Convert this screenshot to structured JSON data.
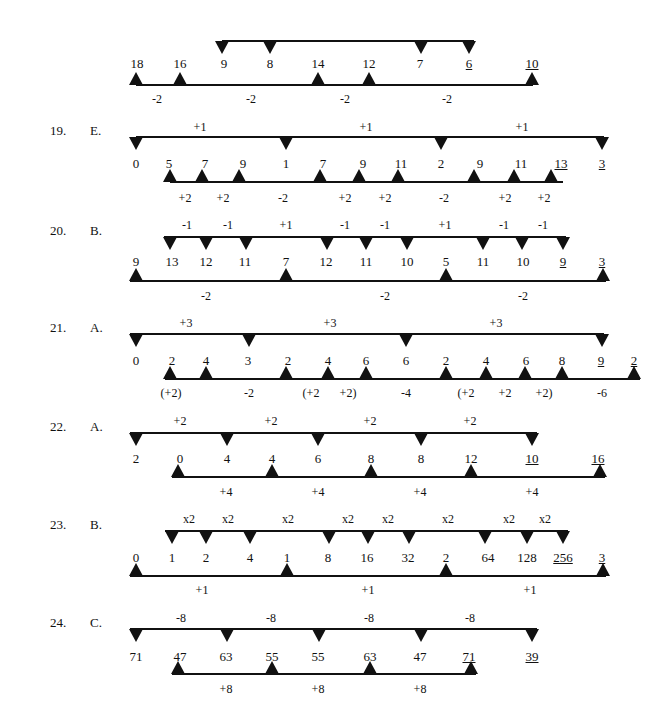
{
  "rows": [
    {
      "id": "top-continued",
      "question": "",
      "answer": "",
      "top_line": {
        "y": 40,
        "x1": 222,
        "x2": 474,
        "markers": [
          222,
          270,
          421,
          469
        ]
      },
      "bottom_line": {
        "y": 84,
        "x1": 136,
        "x2": 533,
        "markers": [
          136,
          180,
          318,
          369,
          532
        ]
      },
      "numbers_y": 57,
      "numbers": [
        {
          "x": 137,
          "v": "18",
          "u": false
        },
        {
          "x": 180,
          "v": "16",
          "u": false
        },
        {
          "x": 224,
          "v": "9",
          "u": false
        },
        {
          "x": 270,
          "v": "8",
          "u": false
        },
        {
          "x": 318,
          "v": "14",
          "u": false
        },
        {
          "x": 369,
          "v": "12",
          "u": false
        },
        {
          "x": 420,
          "v": "7",
          "u": false
        },
        {
          "x": 469,
          "v": "6",
          "u": true
        },
        {
          "x": 532,
          "v": "10",
          "u": true
        }
      ],
      "top_labels_y": 0,
      "top_labels": [],
      "bottom_labels_y": 92,
      "bottom_labels": [
        {
          "x": 157,
          "t": "-2"
        },
        {
          "x": 251,
          "t": "-2"
        },
        {
          "x": 345,
          "t": "-2"
        },
        {
          "x": 447,
          "t": "-2"
        }
      ]
    },
    {
      "id": "q19",
      "question": "19.",
      "answer": "E.",
      "top_line": {
        "y": 136,
        "x1": 136,
        "x2": 604,
        "markers": [
          136,
          286,
          441,
          602
        ]
      },
      "bottom_line": {
        "y": 181,
        "x1": 170,
        "x2": 563,
        "markers": [
          170,
          202,
          239,
          320,
          359,
          398,
          474,
          514,
          551
        ]
      },
      "numbers_y": 157,
      "numbers": [
        {
          "x": 136,
          "v": "0",
          "u": false
        },
        {
          "x": 169,
          "v": "5",
          "u": false
        },
        {
          "x": 205,
          "v": "7",
          "u": false
        },
        {
          "x": 243,
          "v": "9",
          "u": false
        },
        {
          "x": 286,
          "v": "1",
          "u": false
        },
        {
          "x": 323,
          "v": "7",
          "u": false
        },
        {
          "x": 363,
          "v": "9",
          "u": false
        },
        {
          "x": 401,
          "v": "11",
          "u": false
        },
        {
          "x": 441,
          "v": "2",
          "u": false
        },
        {
          "x": 480,
          "v": "9",
          "u": false
        },
        {
          "x": 521,
          "v": "11",
          "u": false
        },
        {
          "x": 561,
          "v": "13",
          "u": true
        },
        {
          "x": 602,
          "v": "3",
          "u": true
        }
      ],
      "top_labels_y": 120,
      "top_labels": [
        {
          "x": 200,
          "t": "+1"
        },
        {
          "x": 366,
          "t": "+1"
        },
        {
          "x": 522,
          "t": "+1"
        }
      ],
      "bottom_labels_y": 191,
      "bottom_labels": [
        {
          "x": 185,
          "t": "+2"
        },
        {
          "x": 223,
          "t": "+2"
        },
        {
          "x": 283,
          "t": "-2"
        },
        {
          "x": 345,
          "t": "+2"
        },
        {
          "x": 385,
          "t": "+2"
        },
        {
          "x": 444,
          "t": "-2"
        },
        {
          "x": 505,
          "t": "+2"
        },
        {
          "x": 544,
          "t": "+2"
        }
      ]
    },
    {
      "id": "q20",
      "question": "20.",
      "answer": "B.",
      "top_line": {
        "y": 236,
        "x1": 164,
        "x2": 566,
        "markers": [
          170,
          206,
          246,
          327,
          366,
          407,
          483,
          522,
          563
        ]
      },
      "bottom_line": {
        "y": 280,
        "x1": 130,
        "x2": 606,
        "markers": [
          136,
          286,
          446,
          603
        ]
      },
      "numbers_y": 255,
      "numbers": [
        {
          "x": 136,
          "v": "9",
          "u": false
        },
        {
          "x": 172,
          "v": "13",
          "u": false
        },
        {
          "x": 206,
          "v": "12",
          "u": false
        },
        {
          "x": 245,
          "v": "11",
          "u": false
        },
        {
          "x": 286,
          "v": "7",
          "u": false
        },
        {
          "x": 326,
          "v": "12",
          "u": false
        },
        {
          "x": 366,
          "v": "11",
          "u": false
        },
        {
          "x": 407,
          "v": "10",
          "u": false
        },
        {
          "x": 446,
          "v": "5",
          "u": false
        },
        {
          "x": 483,
          "v": "11",
          "u": false
        },
        {
          "x": 523,
          "v": "10",
          "u": false
        },
        {
          "x": 563,
          "v": "9",
          "u": true
        },
        {
          "x": 602,
          "v": "3",
          "u": true
        }
      ],
      "top_labels_y": 218,
      "top_labels": [
        {
          "x": 187,
          "t": "-1"
        },
        {
          "x": 228,
          "t": "-1"
        },
        {
          "x": 286,
          "t": "+1"
        },
        {
          "x": 345,
          "t": "-1"
        },
        {
          "x": 385,
          "t": "-1"
        },
        {
          "x": 445,
          "t": "+1"
        },
        {
          "x": 504,
          "t": "-1"
        },
        {
          "x": 543,
          "t": "-1"
        }
      ],
      "bottom_labels_y": 289,
      "bottom_labels": [
        {
          "x": 206,
          "t": "-2"
        },
        {
          "x": 385,
          "t": "-2"
        },
        {
          "x": 523,
          "t": "-2"
        }
      ]
    },
    {
      "id": "q21",
      "question": "21.",
      "answer": "A.",
      "top_line": {
        "y": 333,
        "x1": 130,
        "x2": 604,
        "markers": [
          136,
          249,
          406,
          602
        ]
      },
      "bottom_line": {
        "y": 378,
        "x1": 165,
        "x2": 640,
        "markers": [
          170,
          206,
          286,
          328,
          366,
          446,
          486,
          525,
          562,
          634
        ]
      },
      "numbers_y": 354,
      "numbers": [
        {
          "x": 136,
          "v": "0",
          "u": false
        },
        {
          "x": 172,
          "v": "2",
          "u": false
        },
        {
          "x": 206,
          "v": "4",
          "u": false
        },
        {
          "x": 248,
          "v": "3",
          "u": false
        },
        {
          "x": 288,
          "v": "2",
          "u": false
        },
        {
          "x": 328,
          "v": "4",
          "u": false
        },
        {
          "x": 366,
          "v": "6",
          "u": false
        },
        {
          "x": 406,
          "v": "6",
          "u": false
        },
        {
          "x": 446,
          "v": "2",
          "u": false
        },
        {
          "x": 486,
          "v": "4",
          "u": false
        },
        {
          "x": 526,
          "v": "6",
          "u": false
        },
        {
          "x": 562,
          "v": "8",
          "u": false
        },
        {
          "x": 601,
          "v": "9",
          "u": true
        },
        {
          "x": 634,
          "v": "2",
          "u": true
        }
      ],
      "top_labels_y": 316,
      "top_labels": [
        {
          "x": 186,
          "t": "+3"
        },
        {
          "x": 330,
          "t": "+3"
        },
        {
          "x": 496,
          "t": "+3"
        }
      ],
      "bottom_labels_y": 386,
      "bottom_labels": [
        {
          "x": 171,
          "t": "(+2)"
        },
        {
          "x": 249,
          "t": "-2"
        },
        {
          "x": 311,
          "t": "(+2"
        },
        {
          "x": 348,
          "t": "+2)"
        },
        {
          "x": 406,
          "t": "-4"
        },
        {
          "x": 466,
          "t": "(+2"
        },
        {
          "x": 505,
          "t": "+2"
        },
        {
          "x": 544,
          "t": "+2)"
        },
        {
          "x": 602,
          "t": "-6"
        }
      ]
    },
    {
      "id": "q22",
      "question": "22.",
      "answer": "A.",
      "top_line": {
        "y": 432,
        "x1": 130,
        "x2": 537,
        "markers": [
          136,
          227,
          318,
          421,
          532
        ]
      },
      "bottom_line": {
        "y": 476,
        "x1": 172,
        "x2": 605,
        "markers": [
          178,
          272,
          371,
          471,
          600
        ]
      },
      "numbers_y": 452,
      "numbers": [
        {
          "x": 136,
          "v": "2",
          "u": false
        },
        {
          "x": 180,
          "v": "0",
          "u": false
        },
        {
          "x": 227,
          "v": "4",
          "u": false
        },
        {
          "x": 272,
          "v": "4",
          "u": false
        },
        {
          "x": 318,
          "v": "6",
          "u": false
        },
        {
          "x": 371,
          "v": "8",
          "u": false
        },
        {
          "x": 421,
          "v": "8",
          "u": false
        },
        {
          "x": 471,
          "v": "12",
          "u": false
        },
        {
          "x": 532,
          "v": "10",
          "u": true
        },
        {
          "x": 598,
          "v": "16",
          "u": true
        }
      ],
      "top_labels_y": 414,
      "top_labels": [
        {
          "x": 180,
          "t": "+2"
        },
        {
          "x": 271,
          "t": "+2"
        },
        {
          "x": 370,
          "t": "+2"
        },
        {
          "x": 470,
          "t": "+2"
        }
      ],
      "bottom_labels_y": 485,
      "bottom_labels": [
        {
          "x": 226,
          "t": "+4"
        },
        {
          "x": 318,
          "t": "+4"
        },
        {
          "x": 420,
          "t": "+4"
        },
        {
          "x": 532,
          "t": "+4"
        }
      ]
    },
    {
      "id": "q23",
      "question": "23.",
      "answer": "B.",
      "top_line": {
        "y": 530,
        "x1": 165,
        "x2": 568,
        "markers": [
          172,
          206,
          250,
          329,
          368,
          409,
          485,
          527,
          563
        ]
      },
      "bottom_line": {
        "y": 575,
        "x1": 130,
        "x2": 606,
        "markers": [
          136,
          287,
          446,
          603
        ]
      },
      "numbers_y": 551,
      "numbers": [
        {
          "x": 136,
          "v": "0",
          "u": false
        },
        {
          "x": 172,
          "v": "1",
          "u": false
        },
        {
          "x": 206,
          "v": "2",
          "u": false
        },
        {
          "x": 250,
          "v": "4",
          "u": false
        },
        {
          "x": 287,
          "v": "1",
          "u": false
        },
        {
          "x": 328,
          "v": "8",
          "u": false
        },
        {
          "x": 367,
          "v": "16",
          "u": false
        },
        {
          "x": 408,
          "v": "32",
          "u": false
        },
        {
          "x": 446,
          "v": "2",
          "u": false
        },
        {
          "x": 488,
          "v": "64",
          "u": false
        },
        {
          "x": 527,
          "v": "128",
          "u": false
        },
        {
          "x": 563,
          "v": "256",
          "u": true
        },
        {
          "x": 602,
          "v": "3",
          "u": true
        }
      ],
      "top_labels_y": 512,
      "top_labels": [
        {
          "x": 189,
          "t": "x2"
        },
        {
          "x": 228,
          "t": "x2"
        },
        {
          "x": 288,
          "t": "x2"
        },
        {
          "x": 348,
          "t": "x2"
        },
        {
          "x": 388,
          "t": "x2"
        },
        {
          "x": 448,
          "t": "x2"
        },
        {
          "x": 509,
          "t": "x2"
        },
        {
          "x": 545,
          "t": "x2"
        }
      ],
      "bottom_labels_y": 583,
      "bottom_labels": [
        {
          "x": 202,
          "t": "+1"
        },
        {
          "x": 368,
          "t": "+1"
        },
        {
          "x": 530,
          "t": "+1"
        }
      ]
    },
    {
      "id": "q24",
      "question": "24.",
      "answer": "C.",
      "top_line": {
        "y": 628,
        "x1": 130,
        "x2": 537,
        "markers": [
          136,
          227,
          319,
          421,
          532
        ]
      },
      "bottom_line": {
        "y": 673,
        "x1": 172,
        "x2": 476,
        "markers": [
          178,
          272,
          370,
          471
        ]
      },
      "numbers_y": 650,
      "numbers": [
        {
          "x": 136,
          "v": "71",
          "u": false
        },
        {
          "x": 180,
          "v": "47",
          "u": false
        },
        {
          "x": 226,
          "v": "63",
          "u": false
        },
        {
          "x": 272,
          "v": "55",
          "u": false
        },
        {
          "x": 318,
          "v": "55",
          "u": false
        },
        {
          "x": 370,
          "v": "63",
          "u": false
        },
        {
          "x": 420,
          "v": "47",
          "u": false
        },
        {
          "x": 469,
          "v": "71",
          "u": true
        },
        {
          "x": 532,
          "v": "39",
          "u": true
        }
      ],
      "top_labels_y": 611,
      "top_labels": [
        {
          "x": 181,
          "t": "-8"
        },
        {
          "x": 271,
          "t": "-8"
        },
        {
          "x": 369,
          "t": "-8"
        },
        {
          "x": 470,
          "t": "-8"
        }
      ],
      "bottom_labels_y": 682,
      "bottom_labels": [
        {
          "x": 226,
          "t": "+8"
        },
        {
          "x": 318,
          "t": "+8"
        },
        {
          "x": 420,
          "t": "+8"
        }
      ]
    }
  ]
}
